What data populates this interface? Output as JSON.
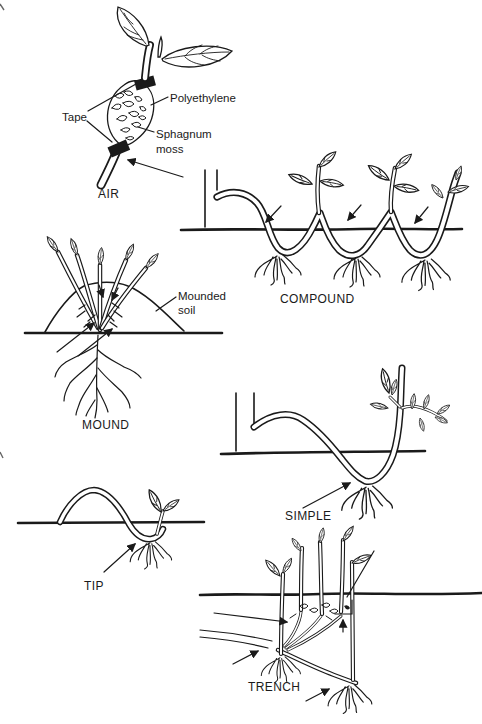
{
  "page": {
    "background": "#ffffff",
    "ink": "#1a1a1a"
  },
  "diagram": {
    "air": {
      "caption": "AIR",
      "label_tape": "Tape",
      "label_polyethylene": "Polyethylene",
      "label_sphagnum_1": "Sphagnum",
      "label_sphagnum_2": "moss"
    },
    "compound": {
      "caption": "COMPOUND"
    },
    "mound": {
      "caption": "MOUND",
      "label_mounded_1": "Mounded",
      "label_mounded_2": "soil"
    },
    "simple": {
      "caption": "SIMPLE"
    },
    "tip": {
      "caption": "TIP"
    },
    "trench": {
      "caption": "TRENCH"
    }
  }
}
